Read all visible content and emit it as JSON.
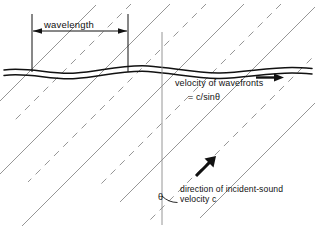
{
  "figure": {
    "background_color": "#ffffff",
    "ink_color": "#111111",
    "ray_color": "#8a8a8a",
    "width": 315,
    "height": 231
  },
  "labels": {
    "wavelength": "wavelength",
    "velocity_of_wavefronts": "velocity of  wavefronts",
    "velocity_formula": "= c/sinθ",
    "direction_incident_sound": "direction of incident-sound",
    "velocity_c": "velocity c",
    "theta": "θ"
  },
  "icons": {
    "dimension_arrow_left": "arrow-left-icon",
    "dimension_arrow_right": "arrow-right-icon",
    "wavefront_velocity_arrow": "arrow-right-icon",
    "incident_direction_arrow": "arrow-up-right-icon"
  },
  "geometry": {
    "surface_band": {
      "description": "wavy double-line interface",
      "y_center": 72,
      "amplitude": 3.5,
      "band_thickness": 6,
      "x_start": 4,
      "x_end": 312
    },
    "normal_line": {
      "x": 162,
      "y_top": 32,
      "y_bottom": 225
    },
    "wavelength_dimension": {
      "y": 31,
      "x_left": 32,
      "x_right": 128,
      "tick_left_x": 32,
      "tick_right_x": 128,
      "tick_y_top": 14,
      "tick_y_bottom": 72
    },
    "angle_arc": {
      "vertex_x": 162,
      "vertex_y": 218,
      "radius": 22,
      "value_label": "θ"
    },
    "rays": {
      "slope_description": "parallel lines descending left-to-right at about -45 degrees",
      "solid_count": 5,
      "dashed_count": 4,
      "alternating": true
    }
  }
}
